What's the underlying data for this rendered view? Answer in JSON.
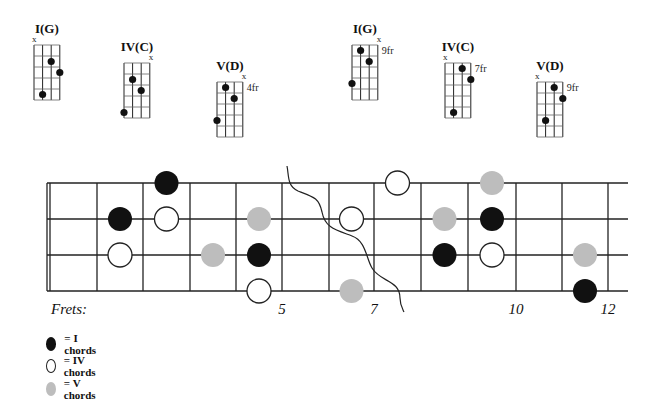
{
  "colors": {
    "line": "#222222",
    "i_chord": "#111111",
    "iv_chord": "#ffffff",
    "v_chord": "#bdbdbd"
  },
  "chord_diagrams": [
    {
      "title": "I(G)",
      "left": 34,
      "top": 45,
      "muted_string": 1,
      "muted_side": "left",
      "fret_label": "",
      "dots": [
        [
          2,
          5
        ],
        [
          3,
          2
        ],
        [
          4,
          3
        ]
      ]
    },
    {
      "title": "IV(C)",
      "left": 124,
      "top": 63,
      "muted_string": 4,
      "muted_side": "right",
      "fret_label": "",
      "dots": [
        [
          1,
          5
        ],
        [
          2,
          2
        ],
        [
          3,
          3
        ]
      ]
    },
    {
      "title": "V(D)",
      "left": 217,
      "top": 82,
      "muted_string": 4,
      "muted_side": "right",
      "fret_label": "4fr",
      "dots": [
        [
          1,
          4
        ],
        [
          2,
          1
        ],
        [
          3,
          2
        ]
      ]
    },
    {
      "title": "I(G)",
      "left": 352,
      "top": 45,
      "muted_string": 4,
      "muted_side": "right",
      "fret_label": "9fr",
      "dots": [
        [
          1,
          4
        ],
        [
          2,
          1
        ],
        [
          3,
          2
        ]
      ]
    },
    {
      "title": "IV(C)",
      "left": 445,
      "top": 63,
      "muted_string": 1,
      "muted_side": "left",
      "fret_label": "7fr",
      "dots": [
        [
          2,
          5
        ],
        [
          3,
          1
        ],
        [
          4,
          2
        ]
      ]
    },
    {
      "title": "V(D)",
      "left": 537,
      "top": 82,
      "muted_string": 1,
      "muted_side": "left",
      "fret_label": "9fr",
      "dots": [
        [
          2,
          4
        ],
        [
          3,
          1
        ],
        [
          4,
          2
        ]
      ]
    }
  ],
  "fretboard": {
    "frets_label": "Frets:",
    "string_y": [
      183,
      219,
      255,
      291
    ],
    "fret_x": [
      47,
      97,
      143,
      190,
      236,
      282,
      329,
      374,
      421,
      468,
      516,
      562,
      608
    ],
    "end_x": 628,
    "fret_numbers": [
      {
        "fret": 5,
        "label": "5"
      },
      {
        "fret": 7,
        "label": "7"
      },
      {
        "fret": 10,
        "label": "10"
      },
      {
        "fret": 12,
        "label": "12"
      }
    ],
    "notes": [
      {
        "string": 1,
        "fret": 3,
        "type": "I"
      },
      {
        "string": 1,
        "fret": 8,
        "type": "IV"
      },
      {
        "string": 1,
        "fret": 10,
        "type": "V"
      },
      {
        "string": 2,
        "fret": 2,
        "type": "I"
      },
      {
        "string": 2,
        "fret": 3,
        "type": "IV"
      },
      {
        "string": 2,
        "fret": 5,
        "type": "V"
      },
      {
        "string": 2,
        "fret": 7,
        "type": "IV"
      },
      {
        "string": 2,
        "fret": 9,
        "type": "V"
      },
      {
        "string": 2,
        "fret": 10,
        "type": "I"
      },
      {
        "string": 3,
        "fret": 2,
        "type": "IV"
      },
      {
        "string": 3,
        "fret": 4,
        "type": "V"
      },
      {
        "string": 3,
        "fret": 5,
        "type": "I"
      },
      {
        "string": 3,
        "fret": 9,
        "type": "I"
      },
      {
        "string": 3,
        "fret": 10,
        "type": "IV"
      },
      {
        "string": 3,
        "fret": 12,
        "type": "V"
      },
      {
        "string": 4,
        "fret": 5,
        "type": "IV"
      },
      {
        "string": 4,
        "fret": 7,
        "type": "V"
      },
      {
        "string": 4,
        "fret": 12,
        "type": "I"
      }
    ]
  },
  "legend": [
    {
      "type": "I",
      "label": "= I chords"
    },
    {
      "type": "IV",
      "label": "= IV chords"
    },
    {
      "type": "V",
      "label": "= V chords"
    }
  ]
}
